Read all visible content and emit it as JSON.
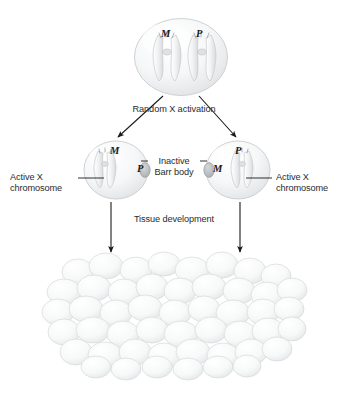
{
  "figure": {
    "background_color": "#ffffff",
    "text_color": "#2b2b2b"
  },
  "labels": {
    "random_x_activation": "Random X activation",
    "tissue_development": "Tissue development",
    "active_x_left": "Active X\nchromosome",
    "active_x_left_line1": "Active X",
    "active_x_left_line2": "chromosome",
    "active_x_right_line1": "Active X",
    "active_x_right_line2": "chromosome",
    "inactive_barr_line1": "Inactive",
    "inactive_barr_line2": "Barr body"
  },
  "cells": {
    "progenitor": {
      "name": "progenitor-cell",
      "chromosomes": [
        {
          "label": "M",
          "meaning": "maternal",
          "state": "active"
        },
        {
          "label": "P",
          "meaning": "paternal",
          "state": "active"
        }
      ]
    },
    "daughter_left": {
      "name": "daughter-cell-left",
      "active_chromosome": "M",
      "inactive_chromosome": "P",
      "barr_body_side": "right"
    },
    "daughter_right": {
      "name": "daughter-cell-right",
      "active_chromosome": "P",
      "inactive_chromosome": "M",
      "barr_body_side": "left"
    }
  },
  "tissue": {
    "name": "tissue-cell-mass",
    "description": "Dense mass of clonally derived cells"
  },
  "colors": {
    "cell_fill": "#f4f5f6",
    "cell_edge": "#c9ccce",
    "chromosome": "#e9ebec",
    "barr_body": "#b9bdc0",
    "arrow": "#1a1a1a"
  }
}
